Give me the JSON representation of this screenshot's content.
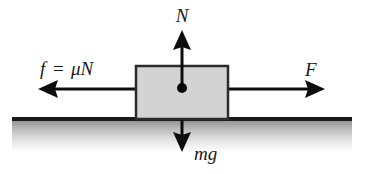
{
  "diagram": {
    "labels": {
      "normal_force": "N",
      "friction_force": "f",
      "friction_equals": "=",
      "friction_expression": "μN",
      "applied_force": "F",
      "weight": "mg"
    },
    "colors": {
      "block_fill": "#d3d3d3",
      "block_stroke": "#2b2b2b",
      "arrow": "#0d0d0d",
      "ground_line": "#1a1a1a",
      "ground_shade_top": "#8e8e8e",
      "ground_shade_bottom": "#ffffff",
      "center_dot": "#000000",
      "background": "#ffffff"
    },
    "geometry": {
      "block": {
        "x": 136,
        "y": 66,
        "width": 92,
        "height": 53
      },
      "center_dot": {
        "cx": 182,
        "cy": 88,
        "r": 5
      },
      "ground_line": {
        "x1": 12,
        "y1": 119,
        "x2": 352,
        "y2": 119
      },
      "ground_shade": {
        "x": 12,
        "y": 119,
        "width": 340,
        "height": 33
      },
      "normal_arrow": {
        "x": 182,
        "y_tail": 88,
        "y_tip": 30
      },
      "weight_arrow": {
        "x": 182,
        "y_tail": 88,
        "y_tip": 152
      },
      "friction_arrow": {
        "y": 89,
        "x_tail": 136,
        "x_tip": 38
      },
      "applied_arrow": {
        "y": 89,
        "x_tail": 228,
        "x_tip": 325
      }
    },
    "label_positions": {
      "normal_force": {
        "x": 182,
        "y": 22
      },
      "friction_force": {
        "x": 40,
        "y": 75
      },
      "applied_force": {
        "x": 305,
        "y": 76
      },
      "weight": {
        "x": 194,
        "y": 160
      }
    }
  }
}
